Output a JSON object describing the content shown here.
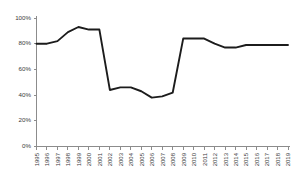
{
  "chart_data": {
    "type": "line",
    "title": "",
    "subtitle": "",
    "xlabel": "",
    "ylabel": "",
    "ylim": [
      0,
      100
    ],
    "y_ticks": [
      0,
      20,
      40,
      60,
      80,
      100
    ],
    "y_tick_labels": [
      "0%",
      "20%",
      "40%",
      "60%",
      "80%",
      "100%"
    ],
    "grid": false,
    "legend": false,
    "legend_position": "none",
    "line_color": "#1c1c1c",
    "axis_color": "#8c8c8c",
    "text_color": "#3a3a3a",
    "background_color": "#ffffff",
    "categories": [
      "1995",
      "1996",
      "1997",
      "1998",
      "1999",
      "2000",
      "2001",
      "2002",
      "2003",
      "2004",
      "2005",
      "2006",
      "2007",
      "2008",
      "2009",
      "2010",
      "2011",
      "2012",
      "2013",
      "2014",
      "2015",
      "2016",
      "2017",
      "2018",
      "2019"
    ],
    "series": [
      {
        "name": "series-1",
        "values": [
          80,
          80,
          82,
          89,
          93,
          91,
          91,
          44,
          46,
          46,
          43,
          38,
          39,
          42,
          84,
          84,
          84,
          80,
          77,
          77,
          79,
          79,
          79,
          79,
          79
        ]
      }
    ]
  }
}
